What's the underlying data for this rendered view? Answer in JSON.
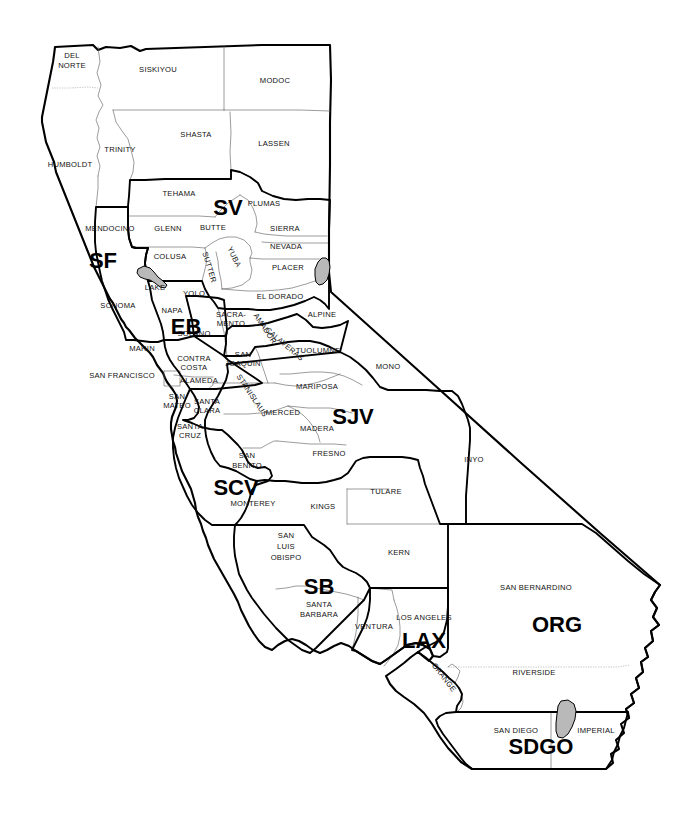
{
  "map": {
    "title": "California Counties and Regions Map",
    "background_color": "#ffffff",
    "outline_color": "#000000",
    "county_line_color": "#5e5e5e",
    "water_color": "#b9b9b9",
    "width": 694,
    "height": 821
  },
  "regions": [
    {
      "code": "SV",
      "name": "Sacramento Valley",
      "x": 228,
      "y": 215,
      "size": 22,
      "rotate": 0
    },
    {
      "code": "SF",
      "name": "San Francisco North",
      "x": 103,
      "y": 268,
      "size": 22,
      "rotate": 0
    },
    {
      "code": "EB",
      "name": "East Bay",
      "x": 186,
      "y": 334,
      "size": 22,
      "rotate": 0
    },
    {
      "code": "SJV",
      "name": "San Joaquin Valley",
      "x": 353,
      "y": 424,
      "size": 22,
      "rotate": 0
    },
    {
      "code": "SCV",
      "name": "Santa Clara Valley",
      "x": 236,
      "y": 495,
      "size": 22,
      "rotate": 0
    },
    {
      "code": "SB",
      "name": "Santa Barbara",
      "x": 319,
      "y": 594,
      "size": 22,
      "rotate": 0
    },
    {
      "code": "LAX",
      "name": "Los Angeles",
      "x": 424,
      "y": 648,
      "size": 22,
      "rotate": 0
    },
    {
      "code": "ORG",
      "name": "Orange / Inland",
      "x": 557,
      "y": 632,
      "size": 22,
      "rotate": 0
    },
    {
      "code": "SDGO",
      "name": "San Diego",
      "x": 541,
      "y": 754,
      "size": 22,
      "rotate": 0
    }
  ],
  "counties": [
    {
      "name": "DEL",
      "x": 72,
      "y": 58,
      "rotate": 0
    },
    {
      "name": "NORTE",
      "x": 72,
      "y": 68,
      "rotate": 0
    },
    {
      "name": "SISKIYOU",
      "x": 158,
      "y": 72,
      "rotate": 0
    },
    {
      "name": "MODOC",
      "x": 275,
      "y": 83,
      "rotate": 0
    },
    {
      "name": "SHASTA",
      "x": 196,
      "y": 137,
      "rotate": 0
    },
    {
      "name": "LASSEN",
      "x": 274,
      "y": 146,
      "rotate": 0
    },
    {
      "name": "TRINITY",
      "x": 120,
      "y": 152,
      "rotate": 0
    },
    {
      "name": "HUMBOLDT",
      "x": 70,
      "y": 167,
      "rotate": 0
    },
    {
      "name": "TEHAMA",
      "x": 179,
      "y": 196,
      "rotate": 0
    },
    {
      "name": "PLUMAS",
      "x": 264,
      "y": 206,
      "rotate": 0
    },
    {
      "name": "BUTTE",
      "x": 213,
      "y": 230,
      "rotate": 0
    },
    {
      "name": "MENDOCINO",
      "x": 110,
      "y": 231,
      "rotate": 0
    },
    {
      "name": "GLENN",
      "x": 168,
      "y": 231,
      "rotate": 0
    },
    {
      "name": "SIERRA",
      "x": 285,
      "y": 231,
      "rotate": 0
    },
    {
      "name": "NEVADA",
      "x": 286,
      "y": 249,
      "rotate": 0
    },
    {
      "name": "COLUSA",
      "x": 170,
      "y": 259,
      "rotate": 0
    },
    {
      "name": "SUTTER",
      "x": 207,
      "y": 268,
      "rotate": 73
    },
    {
      "name": "YUBA",
      "x": 232,
      "y": 258,
      "rotate": 64
    },
    {
      "name": "PLACER",
      "x": 288,
      "y": 270,
      "rotate": 0
    },
    {
      "name": "LAKE",
      "x": 155,
      "y": 290,
      "rotate": 0
    },
    {
      "name": "YOLO",
      "x": 194,
      "y": 296,
      "rotate": 0
    },
    {
      "name": "EL DORADO",
      "x": 280,
      "y": 299,
      "rotate": 0
    },
    {
      "name": "NAPA",
      "x": 172,
      "y": 313,
      "rotate": 0
    },
    {
      "name": "SONOMA",
      "x": 118,
      "y": 308,
      "rotate": 0
    },
    {
      "name": "SACRA-",
      "x": 231,
      "y": 317,
      "rotate": 0
    },
    {
      "name": "MENTO",
      "x": 231,
      "y": 326,
      "rotate": 0
    },
    {
      "name": "ALPINE",
      "x": 322,
      "y": 317,
      "rotate": 0
    },
    {
      "name": "AMADOR",
      "x": 263,
      "y": 330,
      "rotate": 56
    },
    {
      "name": "SOLANO",
      "x": 194,
      "y": 336,
      "rotate": 0
    },
    {
      "name": "CALAVERAS",
      "x": 283,
      "y": 346,
      "rotate": 40
    },
    {
      "name": "MARIN",
      "x": 142,
      "y": 351,
      "rotate": 0
    },
    {
      "name": "TUOLUMNE",
      "x": 318,
      "y": 353,
      "rotate": 0
    },
    {
      "name": "CONTRA",
      "x": 194,
      "y": 361,
      "rotate": 0
    },
    {
      "name": "COSTA",
      "x": 194,
      "y": 370,
      "rotate": 0
    },
    {
      "name": "SAN",
      "x": 243,
      "y": 357,
      "rotate": 0
    },
    {
      "name": "JOAQUIN",
      "x": 243,
      "y": 366,
      "rotate": 0
    },
    {
      "name": "SAN FRANCISCO",
      "x": 122,
      "y": 378,
      "rotate": 0
    },
    {
      "name": "ALAMEDA",
      "x": 199,
      "y": 383,
      "rotate": 0
    },
    {
      "name": "MARIPOSA",
      "x": 317,
      "y": 389,
      "rotate": 0
    },
    {
      "name": "STANISLAUS",
      "x": 250,
      "y": 397,
      "rotate": 56
    },
    {
      "name": "SAN",
      "x": 177,
      "y": 399,
      "rotate": 0
    },
    {
      "name": "MATEO",
      "x": 177,
      "y": 408,
      "rotate": 0
    },
    {
      "name": "SANTA",
      "x": 207,
      "y": 404,
      "rotate": 0
    },
    {
      "name": "CLARA",
      "x": 207,
      "y": 413,
      "rotate": 0
    },
    {
      "name": "MERCED",
      "x": 283,
      "y": 415,
      "rotate": 0
    },
    {
      "name": "MADERA",
      "x": 317,
      "y": 431,
      "rotate": 0
    },
    {
      "name": "SANTA",
      "x": 190,
      "y": 429,
      "rotate": 0
    },
    {
      "name": "CRUZ",
      "x": 190,
      "y": 438,
      "rotate": 0
    },
    {
      "name": "MONO",
      "x": 388,
      "y": 369,
      "rotate": 0
    },
    {
      "name": "FRESNO",
      "x": 329,
      "y": 456,
      "rotate": 0
    },
    {
      "name": "SAN",
      "x": 247,
      "y": 458,
      "rotate": 0
    },
    {
      "name": "BENITO",
      "x": 247,
      "y": 468,
      "rotate": 0
    },
    {
      "name": "INYO",
      "x": 474,
      "y": 462,
      "rotate": 0
    },
    {
      "name": "TULARE",
      "x": 386,
      "y": 494,
      "rotate": 0
    },
    {
      "name": "MONTEREY",
      "x": 253,
      "y": 506,
      "rotate": 0
    },
    {
      "name": "KINGS",
      "x": 323,
      "y": 509,
      "rotate": 0
    },
    {
      "name": "SAN",
      "x": 286,
      "y": 538,
      "rotate": 0
    },
    {
      "name": "LUIS",
      "x": 286,
      "y": 549,
      "rotate": 0
    },
    {
      "name": "OBISPO",
      "x": 286,
      "y": 560,
      "rotate": 0
    },
    {
      "name": "KERN",
      "x": 399,
      "y": 555,
      "rotate": 0
    },
    {
      "name": "SAN BERNARDINO",
      "x": 536,
      "y": 590,
      "rotate": 0
    },
    {
      "name": "SANTA",
      "x": 319,
      "y": 607,
      "rotate": 0
    },
    {
      "name": "BARBARA",
      "x": 319,
      "y": 617,
      "rotate": 0
    },
    {
      "name": "LOS ANGELES",
      "x": 424,
      "y": 620,
      "rotate": 0
    },
    {
      "name": "VENTURA",
      "x": 374,
      "y": 629,
      "rotate": 0
    },
    {
      "name": "ORANGE",
      "x": 442,
      "y": 679,
      "rotate": 52
    },
    {
      "name": "RIVERSIDE",
      "x": 534,
      "y": 675,
      "rotate": 0
    },
    {
      "name": "SAN DIEGO",
      "x": 516,
      "y": 733,
      "rotate": 0
    },
    {
      "name": "IMPERIAL",
      "x": 596,
      "y": 733,
      "rotate": 0
    }
  ],
  "water_bodies": [
    {
      "name": "Lake Tahoe",
      "code": "lake-tahoe"
    },
    {
      "name": "Clear Lake",
      "code": "clear-lake"
    },
    {
      "name": "Salton Sea",
      "code": "salton-sea"
    }
  ]
}
